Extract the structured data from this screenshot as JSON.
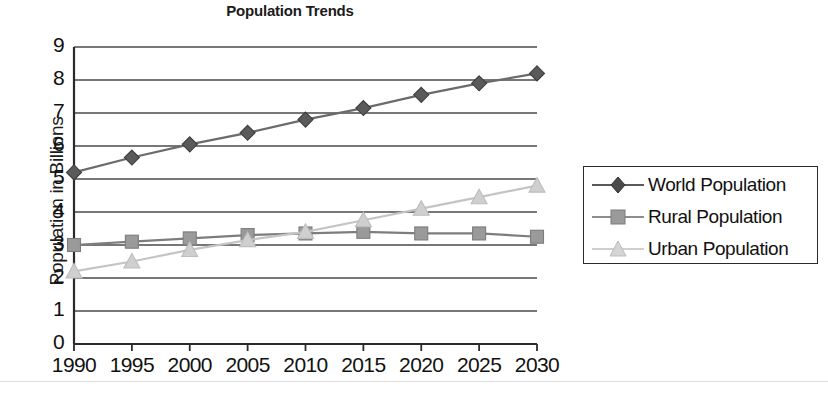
{
  "chart_data": {
    "type": "line",
    "title": "Population Trends",
    "xlabel": "",
    "ylabel": "Population in Billions",
    "categories": [
      "1990",
      "1995",
      "2000",
      "2005",
      "2010",
      "2015",
      "2020",
      "2025",
      "2030"
    ],
    "x": [
      1990,
      1995,
      2000,
      2005,
      2010,
      2015,
      2020,
      2025,
      2030
    ],
    "ylim": [
      0,
      9
    ],
    "xlim": [
      1990,
      2030
    ],
    "ytick_labels": [
      "0",
      "1",
      "2",
      "3",
      "4",
      "5",
      "6",
      "7",
      "8",
      "9"
    ],
    "yticks": [
      0,
      1,
      2,
      3,
      4,
      5,
      6,
      7,
      8,
      9
    ],
    "grid": true,
    "grid_axis": "y",
    "legend_position": "right-outside",
    "series": [
      {
        "name": "World Population",
        "marker": "diamond",
        "color": "#5a5a5a",
        "line_color": "#6b6b6b",
        "values": [
          5.2,
          5.65,
          6.05,
          6.4,
          6.8,
          7.15,
          7.55,
          7.9,
          8.2
        ]
      },
      {
        "name": "Rural Population",
        "marker": "square",
        "color": "#9a9a9a",
        "line_color": "#7d7d7d",
        "values": [
          3.0,
          3.1,
          3.2,
          3.3,
          3.35,
          3.4,
          3.35,
          3.35,
          3.25
        ]
      },
      {
        "name": "Urban Population",
        "marker": "triangle",
        "color": "#cfcfcf",
        "line_color": "#c4c4c4",
        "values": [
          2.2,
          2.5,
          2.85,
          3.15,
          3.4,
          3.75,
          4.1,
          4.45,
          4.8
        ]
      }
    ]
  },
  "legend": {
    "items": [
      {
        "label": "World Population"
      },
      {
        "label": "Rural Population"
      },
      {
        "label": "Urban Population"
      }
    ]
  },
  "colors": {
    "world": "#5a5a5a",
    "rural": "#9a9a9a",
    "urban": "#cfcfcf",
    "axis": "#2a2a2a",
    "grid": "#4a4a4a",
    "text": "#111111",
    "background": "#ffffff"
  }
}
